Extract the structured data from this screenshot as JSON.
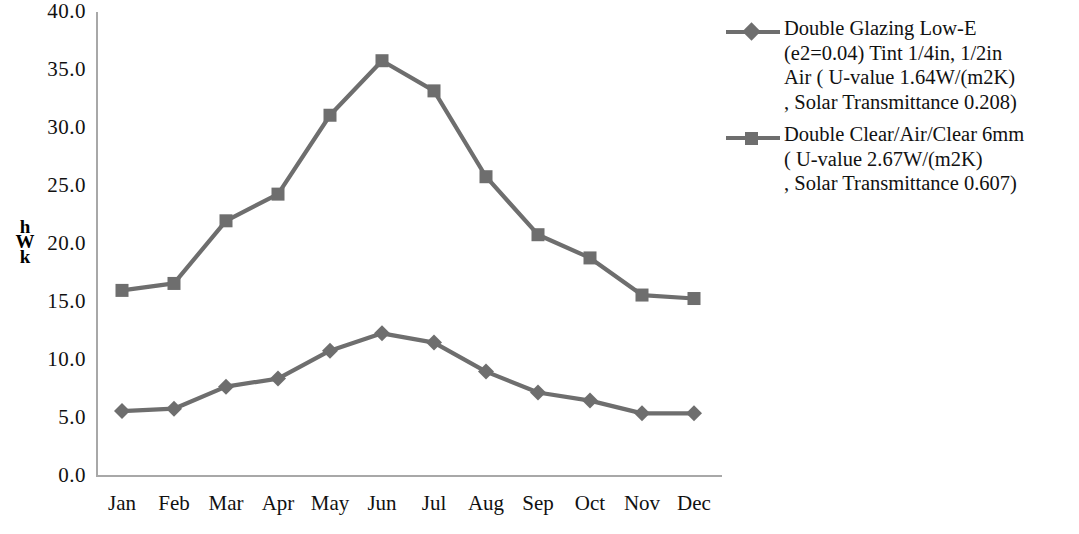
{
  "chart_data": {
    "type": "line",
    "title": "",
    "subtitle": "",
    "xlabel": "",
    "ylabel": "kWh",
    "ylabel_stacked": [
      "h",
      "W",
      "k"
    ],
    "categories": [
      "Jan",
      "Feb",
      "Mar",
      "Apr",
      "May",
      "Jun",
      "Jul",
      "Aug",
      "Sep",
      "Oct",
      "Nov",
      "Dec"
    ],
    "ylim": [
      0.0,
      40.0
    ],
    "yticks": [
      "40.0",
      "35.0",
      "30.0",
      "25.0",
      "20.0",
      "15.0",
      "10.0",
      "5.0",
      "0.0"
    ],
    "ytick_values": [
      40.0,
      35.0,
      30.0,
      25.0,
      20.0,
      15.0,
      10.0,
      5.0,
      0.0
    ],
    "grid": false,
    "legend_position": "right",
    "series": [
      {
        "name": "Double Glazing Low-E (e2=0.04) Tint 1/4in, 1/2in Air ( U-value 1.64W/(m2K) , Solar Transmittance 0.208)",
        "marker": "diamond",
        "color": "#6e6e6e",
        "values": [
          5.6,
          5.8,
          7.7,
          8.4,
          10.8,
          12.3,
          11.5,
          9.0,
          7.2,
          6.5,
          5.4,
          5.4
        ]
      },
      {
        "name": "Double Clear/Air/Clear 6mm ( U-value 2.67W/(m2K) , Solar Transmittance 0.607)",
        "marker": "square",
        "color": "#6e6e6e",
        "values": [
          16.0,
          16.6,
          22.0,
          24.3,
          31.1,
          35.8,
          33.2,
          25.8,
          20.8,
          18.8,
          15.6,
          15.3
        ]
      }
    ]
  },
  "legend": {
    "entries": [
      {
        "marker": "diamond",
        "lines": [
          "Double Glazing Low-E",
          "(e2=0.04) Tint 1/4in, 1/2in",
          "Air ( U-value 1.64W/(m2K)",
          ", Solar Transmittance 0.208)"
        ]
      },
      {
        "marker": "square",
        "lines": [
          "Double Clear/Air/Clear 6mm",
          "( U-value 2.67W/(m2K)",
          ", Solar Transmittance 0.607)"
        ]
      }
    ]
  },
  "axis": {
    "line_color": "#a8a8a8",
    "text_color": "#111111"
  }
}
